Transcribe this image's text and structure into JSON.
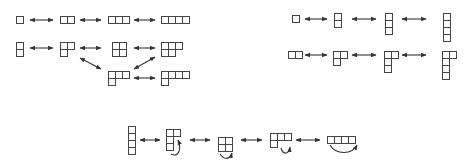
{
  "figure": {
    "colors": {
      "stroke": "#444444",
      "background": "#ffffff"
    },
    "groups": [
      {
        "name": "top-left",
        "diagrams": [
          {
            "id": "a1",
            "shape": [
              1
            ]
          },
          {
            "id": "a2",
            "shape": [
              2
            ]
          },
          {
            "id": "a3",
            "shape": [
              3
            ]
          },
          {
            "id": "a4",
            "shape": [
              4
            ]
          },
          {
            "id": "b1",
            "shape": [
              1,
              1
            ]
          },
          {
            "id": "b2",
            "shape": [
              2,
              1
            ]
          },
          {
            "id": "b3",
            "shape": [
              2,
              2
            ]
          },
          {
            "id": "b4",
            "shape": [
              3,
              2
            ]
          },
          {
            "id": "c1",
            "shape": [
              3,
              1
            ]
          },
          {
            "id": "c2",
            "shape": [
              4,
              1
            ]
          }
        ]
      },
      {
        "name": "top-right",
        "diagrams": [
          {
            "id": "d1",
            "shape": [
              1
            ]
          },
          {
            "id": "d2",
            "shape": [
              1,
              1
            ]
          },
          {
            "id": "d3",
            "shape": [
              1,
              1,
              1
            ]
          },
          {
            "id": "d4",
            "shape": [
              1,
              1,
              1,
              1
            ]
          },
          {
            "id": "e1",
            "shape": [
              2
            ]
          },
          {
            "id": "e2",
            "shape": [
              2,
              1
            ]
          },
          {
            "id": "e3",
            "shape": [
              2,
              1,
              1
            ]
          },
          {
            "id": "e4",
            "shape": [
              2,
              1,
              1,
              1
            ]
          }
        ]
      },
      {
        "name": "bottom",
        "diagrams": [
          {
            "id": "f1",
            "shape": [
              1,
              1,
              1,
              1
            ]
          },
          {
            "id": "f2",
            "shape": [
              2,
              1,
              1
            ],
            "curved_arrow": true
          },
          {
            "id": "f3",
            "shape": [
              2,
              2
            ],
            "curved_arrow": true
          },
          {
            "id": "f4",
            "shape": [
              3,
              1
            ],
            "curved_arrow": true
          },
          {
            "id": "f5",
            "shape": [
              4
            ],
            "curved_arrow": true
          }
        ]
      }
    ]
  }
}
